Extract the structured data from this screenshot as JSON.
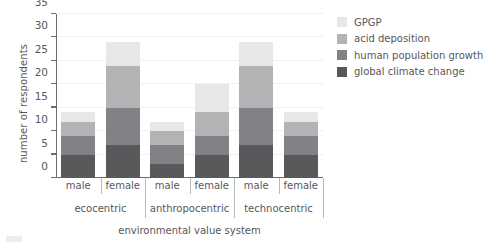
{
  "chart_data": {
    "type": "bar",
    "subtype": "stacked",
    "title": "",
    "xlabel": "environmental value system",
    "ylabel": "number of respondents",
    "ylim": [
      0,
      35
    ],
    "ytick_labels": [
      "0",
      "5",
      "10",
      "15",
      "20",
      "25",
      "30",
      "35"
    ],
    "ytick_values": [
      0,
      5,
      10,
      15,
      20,
      25,
      30,
      35
    ],
    "grid": true,
    "legend_position": "right",
    "categories": [
      "male",
      "female",
      "male",
      "female",
      "male",
      "female"
    ],
    "groups": [
      "ecocentric",
      "anthropocentric",
      "technocentric"
    ],
    "series": [
      {
        "name": "global climate change",
        "color": "#58595b",
        "values": [
          5,
          7,
          3,
          5,
          7,
          5
        ]
      },
      {
        "name": "human population growth",
        "color": "#808285",
        "values": [
          4,
          8,
          4,
          4,
          8,
          4
        ]
      },
      {
        "name": "acid deposition",
        "color": "#b1b3b5",
        "values": [
          3,
          9,
          3,
          5,
          9,
          3
        ]
      },
      {
        "name": "GPGP",
        "color": "#e6e7e8",
        "values": [
          2,
          5,
          2,
          6,
          5,
          2
        ]
      }
    ],
    "totals": [
      14,
      29,
      12,
      20,
      29,
      14
    ]
  },
  "axes": {
    "y_title": "number of respondents",
    "x_title": "environmental value system",
    "y_ticks": [
      {
        "label": "35",
        "value": 35
      },
      {
        "label": "30",
        "value": 30
      },
      {
        "label": "25",
        "value": 25
      },
      {
        "label": "20",
        "value": 20
      },
      {
        "label": "15",
        "value": 15
      },
      {
        "label": "10",
        "value": 10
      },
      {
        "label": "5",
        "value": 5
      },
      {
        "label": "0",
        "value": 0
      }
    ],
    "gender_labels": [
      "male",
      "female",
      "male",
      "female",
      "male",
      "female"
    ],
    "group_labels": [
      "ecocentric",
      "anthropocentric",
      "technocentric"
    ]
  },
  "legend": {
    "items": [
      {
        "label": "GPGP",
        "color": "#e6e7e8"
      },
      {
        "label": "acid deposition",
        "color": "#b1b3b5"
      },
      {
        "label": "human population growth",
        "color": "#808285"
      },
      {
        "label": "global climate change",
        "color": "#58595b"
      }
    ]
  },
  "colors": {
    "axis": "#6d6e70",
    "text": "#58585a",
    "grid": "#f0f0f0",
    "separator": "#b9babc"
  }
}
